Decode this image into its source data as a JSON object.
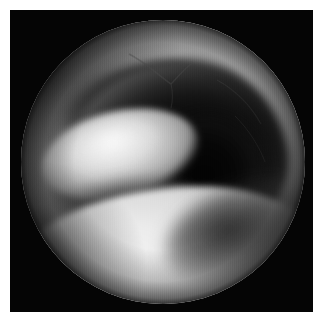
{
  "page": {
    "kind": "photographic-figure",
    "background_color": "#ffffff",
    "width": 323,
    "height": 320
  },
  "figure": {
    "name": "endoscopic-photograph",
    "modality": "endoscopy",
    "color_mode": "grayscale",
    "caption": "",
    "frame": {
      "background_color": "#050505",
      "left": 10,
      "top": 10,
      "width": 303,
      "height": 302
    },
    "field_of_view": {
      "shape": "circle",
      "center_x": 163,
      "center_y": 162,
      "radius": 142,
      "border_color": "#050505"
    },
    "regions": [
      {
        "name": "upper-mucosal-dome",
        "description": "broad pale mucosal surface filling the upper and upper-right of the field",
        "tone": "light-gray",
        "color": "#bdbdbd"
      },
      {
        "name": "dark-cavity",
        "description": "large dark crescent-shaped airway cavity occupying the centre and right",
        "tone": "near-black",
        "color": "#0a0a0a"
      },
      {
        "name": "bright-oval-structure",
        "description": "elongated rounded bright structure left of centre, tilted up to the right",
        "tone": "bright",
        "color": "#e6e6e6"
      },
      {
        "name": "lower-bright-band",
        "description": "wide curving bright band sweeping across the lower half of the field",
        "tone": "very-bright",
        "color": "#eeeeee"
      },
      {
        "name": "rim-vignette",
        "description": "progressive darkening toward the circular edge of the endoscope view",
        "tone": "dark",
        "color": "#2a2a2a"
      },
      {
        "name": "vessel-marking",
        "description": "faint thin dark vascular or crease line near the top of the field",
        "tone": "mid-gray",
        "color": "#6a6a6a"
      }
    ],
    "palette": {
      "frame": "#050505",
      "page": "#ffffff",
      "highlight": "#f4f4f4",
      "midtone": "#8e8e8e",
      "shadow": "#0a0a0a"
    }
  }
}
